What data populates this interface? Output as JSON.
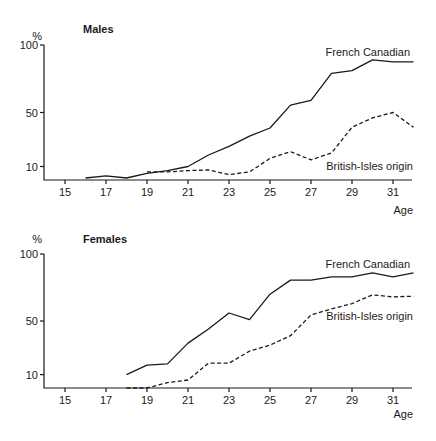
{
  "chart_data": [
    {
      "type": "line",
      "title": "Males",
      "ylabel": "%",
      "xlabel": "Age",
      "ylim": [
        0,
        100
      ],
      "xlim": [
        14,
        32
      ],
      "yticks": [
        10,
        50,
        100
      ],
      "xticks": [
        15,
        17,
        19,
        21,
        23,
        25,
        27,
        29,
        31
      ],
      "grid": false,
      "legend": "inline labels at right",
      "series": [
        {
          "name": "French Canadian",
          "style": "solid",
          "x": [
            16,
            17,
            18,
            19,
            20,
            21,
            22,
            23,
            24,
            25,
            26,
            27,
            28,
            29,
            30,
            31,
            32
          ],
          "values": [
            1.5,
            3,
            1.5,
            5,
            7,
            10,
            18.5,
            25,
            32.5,
            38.5,
            55.5,
            59,
            79,
            81,
            89,
            87.5,
            87.5
          ]
        },
        {
          "name": "British-Isles origin",
          "style": "dashed",
          "x": [
            19,
            20,
            21,
            22,
            23,
            24,
            25,
            26,
            27,
            28,
            29,
            30,
            31,
            32
          ],
          "values": [
            6,
            6,
            7,
            7.5,
            4,
            6,
            16,
            21,
            15,
            20,
            39,
            46,
            50,
            39
          ]
        }
      ]
    },
    {
      "type": "line",
      "title": "Females",
      "ylabel": "%",
      "xlabel": "Age",
      "ylim": [
        0,
        100
      ],
      "xlim": [
        14,
        32
      ],
      "yticks": [
        10,
        50,
        100
      ],
      "xticks": [
        15,
        17,
        19,
        21,
        23,
        25,
        27,
        29,
        31
      ],
      "grid": false,
      "legend": "inline labels at right",
      "series": [
        {
          "name": "French Canadian",
          "style": "solid",
          "x": [
            18,
            19,
            20,
            21,
            22,
            23,
            24,
            25,
            26,
            27,
            28,
            29,
            30,
            31,
            32
          ],
          "values": [
            10,
            17,
            18,
            33.5,
            44,
            56,
            51,
            70,
            80.5,
            80.5,
            83,
            83,
            86,
            83,
            86
          ]
        },
        {
          "name": "British-Isles origin",
          "style": "dashed",
          "x": [
            18,
            19,
            20,
            21,
            22,
            23,
            24,
            25,
            26,
            27,
            28,
            29,
            30,
            31,
            32
          ],
          "values": [
            0,
            0,
            4,
            6,
            18.5,
            18.5,
            27.5,
            32,
            39,
            54.5,
            59,
            63,
            69.5,
            68,
            68.5
          ]
        }
      ]
    }
  ],
  "panels": [
    {
      "title": "Males",
      "y_unit": "%",
      "x_axis_label": "Age",
      "series_labels": {
        "french_canadian": "French Canadian",
        "british_isles": "British-Isles origin"
      }
    },
    {
      "title": "Females",
      "y_unit": "%",
      "x_axis_label": "Age",
      "series_labels": {
        "french_canadian": "French Canadian",
        "british_isles": "British-Isles origin"
      }
    }
  ]
}
